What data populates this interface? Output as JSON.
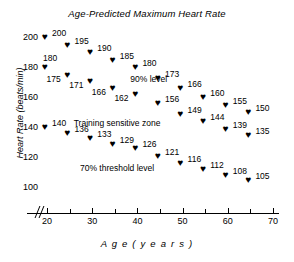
{
  "chart_data": {
    "type": "scatter",
    "title": "Age-Predicted Maximum Heart Rate",
    "xlabel": "A g e   ( y e a r s )",
    "ylabel": "Heart Rate (beats/min)",
    "xlim": [
      17,
      70
    ],
    "ylim": [
      95,
      207
    ],
    "grid": false,
    "legend": null,
    "marker": "heart",
    "xticks": [
      20,
      25,
      30,
      35,
      40,
      45,
      50,
      55,
      60,
      65,
      70
    ],
    "xticklabels": [
      "20",
      "",
      "30",
      "",
      "40",
      "",
      "50",
      "",
      "60",
      "",
      "70"
    ],
    "yticks": [
      200,
      180,
      160,
      140,
      120,
      100
    ],
    "yticklabels": [
      "200",
      "180",
      "160",
      "140",
      "120",
      "100"
    ],
    "axis_break": true,
    "annotations": [
      {
        "text": "90% level",
        "x": 42.5,
        "y": 172
      },
      {
        "text": "Training sensitive zone",
        "x": 35.5,
        "y": 143
      },
      {
        "text": "70% threshold level",
        "x": 35.5,
        "y": 113
      }
    ],
    "series": [
      {
        "name": "Maximum heart rate",
        "points": [
          {
            "x": 20,
            "y": 200,
            "label": "200",
            "label_side": "right"
          },
          {
            "x": 25,
            "y": 195,
            "label": "195",
            "label_side": "right"
          },
          {
            "x": 30,
            "y": 190,
            "label": "190",
            "label_side": "right"
          },
          {
            "x": 35,
            "y": 185,
            "label": "185",
            "label_side": "right"
          },
          {
            "x": 40,
            "y": 180,
            "label": "180",
            "label_side": "right"
          },
          {
            "x": 45,
            "y": 173,
            "label": "173",
            "label_side": "right"
          },
          {
            "x": 50,
            "y": 166,
            "label": "166",
            "label_side": "right"
          },
          {
            "x": 55,
            "y": 160,
            "label": "160",
            "label_side": "right"
          },
          {
            "x": 60,
            "y": 155,
            "label": "155",
            "label_side": "right"
          },
          {
            "x": 65,
            "y": 150,
            "label": "150",
            "label_side": "right"
          }
        ]
      },
      {
        "name": "90% level",
        "points": [
          {
            "x": 20,
            "y": 180,
            "label": "180",
            "label_side": "above"
          },
          {
            "x": 25,
            "y": 175,
            "label": "175",
            "label_side": "left"
          },
          {
            "x": 30,
            "y": 171,
            "label": "171",
            "label_side": "left"
          },
          {
            "x": 35,
            "y": 166,
            "label": "166",
            "label_side": "left"
          },
          {
            "x": 40,
            "y": 162,
            "label": "162",
            "label_side": "left"
          },
          {
            "x": 45,
            "y": 156,
            "label": "156",
            "label_side": "right"
          },
          {
            "x": 50,
            "y": 149,
            "label": "149",
            "label_side": "right"
          },
          {
            "x": 55,
            "y": 144,
            "label": "144",
            "label_side": "right"
          },
          {
            "x": 60,
            "y": 139,
            "label": "139",
            "label_side": "right"
          },
          {
            "x": 65,
            "y": 135,
            "label": "135",
            "label_side": "right"
          }
        ]
      },
      {
        "name": "70% threshold level",
        "points": [
          {
            "x": 20,
            "y": 140,
            "label": "140",
            "label_side": "right"
          },
          {
            "x": 25,
            "y": 136,
            "label": "136",
            "label_side": "right"
          },
          {
            "x": 30,
            "y": 133,
            "label": "133",
            "label_side": "right"
          },
          {
            "x": 35,
            "y": 129,
            "label": "129",
            "label_side": "right"
          },
          {
            "x": 40,
            "y": 126,
            "label": "126",
            "label_side": "right"
          },
          {
            "x": 45,
            "y": 121,
            "label": "121",
            "label_side": "right"
          },
          {
            "x": 50,
            "y": 116,
            "label": "116",
            "label_side": "right"
          },
          {
            "x": 55,
            "y": 112,
            "label": "112",
            "label_side": "right"
          },
          {
            "x": 60,
            "y": 108,
            "label": "108",
            "label_side": "right"
          },
          {
            "x": 65,
            "y": 105,
            "label": "105",
            "label_side": "right"
          }
        ]
      }
    ]
  }
}
